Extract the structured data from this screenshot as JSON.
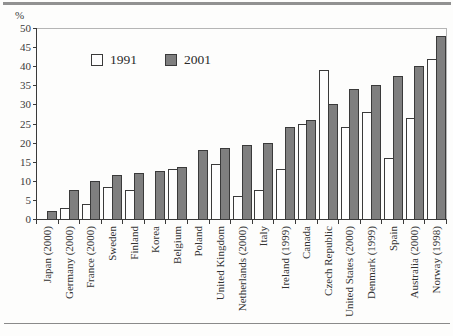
{
  "page": {
    "background": "#fdfdfc",
    "top_rule_color": "#919191",
    "bottom_rule_color": "#8a8a8a"
  },
  "chart_data": {
    "type": "bar",
    "title": "",
    "ylabel": "%",
    "xlabel": "",
    "ylim": [
      0,
      50
    ],
    "ytick_step": 5,
    "grid": false,
    "legend_position": "top-center",
    "axis_color": "#3a3a3a",
    "frame_color": "#b5b5b5",
    "tick_label_color": "#3a3a3a",
    "categories": [
      "Japan (2000)",
      "Germany (2000)",
      "France (2000)",
      "Sweden",
      "Finland",
      "Korea",
      "Belgium",
      "Poland",
      "United Kingdom",
      "Netherlands (2000)",
      "Italy",
      "Ireland (1999)",
      "Canada",
      "Czech Republic",
      "United States (2000)",
      "Denmark (1999)",
      "Spain",
      "Australia (2000)",
      "Norway (1998)"
    ],
    "series": [
      {
        "name": "1991",
        "color": "#fefefe",
        "border": "#3a3a3a",
        "values": [
          null,
          3,
          4,
          8.5,
          7.5,
          null,
          13,
          null,
          14.5,
          6,
          7.5,
          13,
          25,
          39,
          24,
          28,
          16,
          26.5,
          42
        ]
      },
      {
        "name": "2001",
        "color": "#7f7f7f",
        "border": "#3a3a3a",
        "values": [
          2,
          7.5,
          10,
          11.5,
          12,
          12.5,
          13.5,
          18,
          18.5,
          19.5,
          20,
          24,
          26,
          30,
          34,
          35,
          37.5,
          40,
          48
        ]
      }
    ]
  }
}
